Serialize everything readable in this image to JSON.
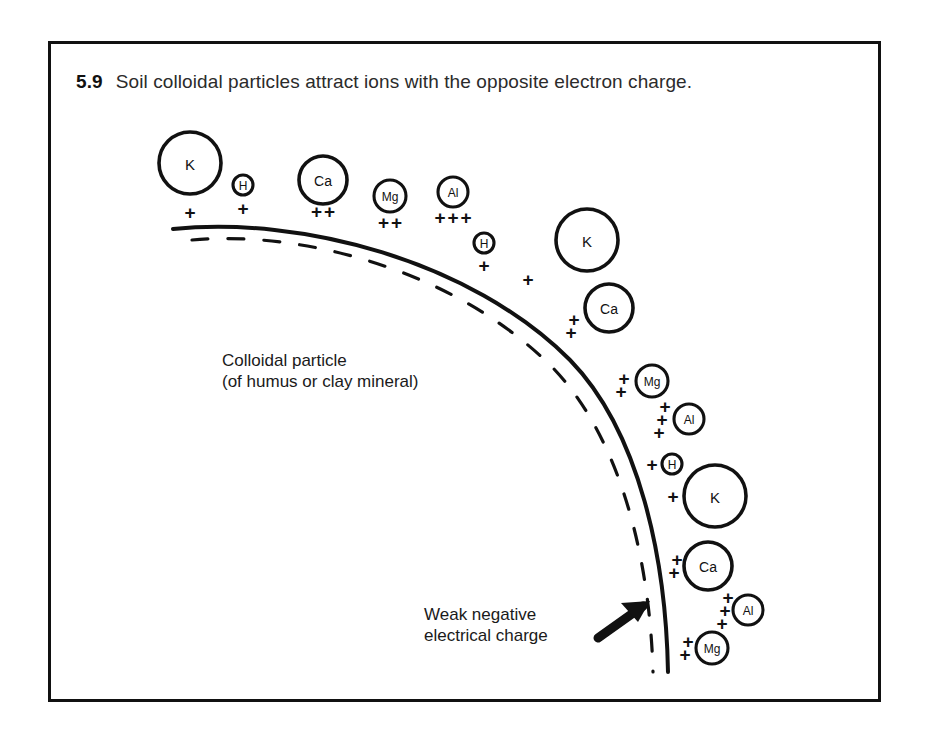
{
  "figure": {
    "number": "5.9",
    "caption": "Soil colloidal particles attract ions with the opposite electron charge."
  },
  "annotations": {
    "colloid_line1": "Colloidal particle",
    "colloid_line2": "(of humus or clay mineral)",
    "charge_line1": "Weak negative",
    "charge_line2": "electrical charge"
  },
  "colors": {
    "ink": "#111111",
    "caption_text": "#2b2b2b",
    "background": "#ffffff"
  },
  "diagram": {
    "particle_surface": "solid arc",
    "inner_boundary": "dashed arc",
    "arrow": "arrow-pointing-to-surface"
  },
  "ions": [
    {
      "symbol": "K",
      "charge": 1,
      "cx": 190,
      "cy": 163,
      "r": 31,
      "size": "lg",
      "plus_layout": "row",
      "px": 190,
      "py": 212
    },
    {
      "symbol": "H",
      "charge": 1,
      "cx": 243,
      "cy": 185,
      "r": 10,
      "size": "sm",
      "plus_layout": "row",
      "px": 243,
      "py": 208
    },
    {
      "symbol": "Ca",
      "charge": 2,
      "cx": 323,
      "cy": 180,
      "r": 24,
      "size": "md",
      "plus_layout": "row",
      "px": 323,
      "py": 211
    },
    {
      "symbol": "Mg",
      "charge": 2,
      "cx": 390,
      "cy": 196,
      "r": 16,
      "size": "sm",
      "plus_layout": "row",
      "px": 390,
      "py": 222
    },
    {
      "symbol": "Al",
      "charge": 3,
      "cx": 453,
      "cy": 192,
      "r": 15,
      "size": "sm",
      "plus_layout": "row",
      "px": 453,
      "py": 217
    },
    {
      "symbol": "H",
      "charge": 1,
      "cx": 484,
      "cy": 243,
      "r": 10,
      "size": "sm",
      "plus_layout": "row",
      "px": 484,
      "py": 265
    },
    {
      "symbol": "K",
      "charge": 1,
      "cx": 587,
      "cy": 240,
      "r": 31,
      "size": "lg",
      "plus_layout": "left",
      "px": 528,
      "py": 279
    },
    {
      "symbol": "Ca",
      "charge": 2,
      "cx": 609,
      "cy": 308,
      "r": 24,
      "size": "md",
      "plus_layout": "left-stack",
      "px": 574,
      "py": 326
    },
    {
      "symbol": "Mg",
      "charge": 2,
      "cx": 652,
      "cy": 381,
      "r": 16,
      "size": "sm",
      "plus_layout": "left-stack",
      "px": 624,
      "py": 385
    },
    {
      "symbol": "Al",
      "charge": 3,
      "cx": 689,
      "cy": 419,
      "r": 15,
      "size": "sm",
      "plus_layout": "left-stack",
      "px": 665,
      "py": 419
    },
    {
      "symbol": "H",
      "charge": 1,
      "cx": 672,
      "cy": 464,
      "r": 10,
      "size": "sm",
      "plus_layout": "left",
      "px": 652,
      "py": 464
    },
    {
      "symbol": "K",
      "charge": 1,
      "cx": 715,
      "cy": 496,
      "r": 31,
      "size": "lg",
      "plus_layout": "left",
      "px": 673,
      "py": 496
    },
    {
      "symbol": "Ca",
      "charge": 2,
      "cx": 708,
      "cy": 566,
      "r": 24,
      "size": "md",
      "plus_layout": "left-stack",
      "px": 677,
      "py": 566
    },
    {
      "symbol": "Al",
      "charge": 3,
      "cx": 748,
      "cy": 610,
      "r": 15,
      "size": "sm",
      "plus_layout": "left-stack",
      "px": 728,
      "py": 610
    },
    {
      "symbol": "Mg",
      "charge": 2,
      "cx": 712,
      "cy": 648,
      "r": 16,
      "size": "sm",
      "plus_layout": "left-stack",
      "px": 688,
      "py": 648
    }
  ]
}
